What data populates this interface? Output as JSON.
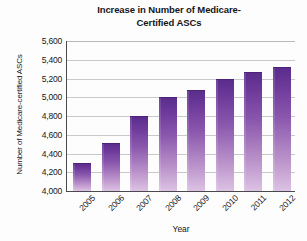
{
  "chart_data": {
    "type": "bar",
    "title_line1": "Increase in Number of Medicare-",
    "title_line2": "Certified ASCs",
    "xlabel": "Year",
    "ylabel": "Number of Medicare-certified ASCs",
    "categories": [
      "2005",
      "2006",
      "2007",
      "2008",
      "2009",
      "2010",
      "2011",
      "2012"
    ],
    "values": [
      4300,
      4510,
      4800,
      5000,
      5080,
      5200,
      5270,
      5320
    ],
    "ylim": [
      4000,
      5600
    ],
    "ytick_step": 200,
    "ytick_labels": [
      "5,600",
      "5,400",
      "5,200",
      "5,000",
      "4,800",
      "4,600",
      "4,400",
      "4,200",
      "4,000"
    ],
    "ytick_values": [
      5600,
      5400,
      5200,
      5000,
      4800,
      4600,
      4400,
      4200,
      4000
    ],
    "grid": true,
    "legend": false,
    "legend_position": "none",
    "bar_color_top": "#5A2D8C",
    "bar_color_bottom": "#DCC2E3",
    "axis_color": "#4A4A4E",
    "gridline_color": "#C9C9CC"
  }
}
